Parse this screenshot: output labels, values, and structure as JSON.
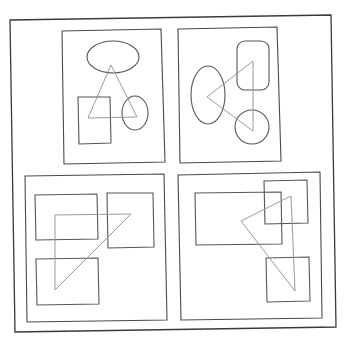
{
  "diagram": {
    "colors": {
      "background": "#ffffff",
      "frame": "#3a3a3a",
      "panel": "#4a4a4a",
      "shape": "#555555",
      "triangle": "#9a9a9a"
    },
    "outer_frame": {
      "points": "10,20 331,15 336,327 15,332"
    },
    "panels": [
      {
        "id": "top-left",
        "border": "62,31 161,29 165,162 64,164",
        "shapes": [
          {
            "type": "ellipse",
            "cx": 113,
            "cy": 57,
            "rx": 26,
            "ry": 16
          },
          {
            "type": "rect",
            "points": "78,97 110,97 111,143 79,144"
          },
          {
            "type": "ellipse",
            "cx": 135,
            "cy": 113,
            "rx": 13,
            "ry": 17
          }
        ],
        "triangle": "111,65 137,117 88,118"
      },
      {
        "id": "top-right",
        "border": "178,29 277,27 281,161 180,163",
        "shapes": [
          {
            "type": "ellipse",
            "cx": 208,
            "cy": 95,
            "rx": 17,
            "ry": 29
          },
          {
            "type": "roundrect",
            "x": 237,
            "y": 41,
            "w": 32,
            "h": 49,
            "r": 8
          },
          {
            "type": "ellipse",
            "cx": 252,
            "cy": 127,
            "rx": 17,
            "ry": 17
          }
        ],
        "triangle": "207,97 253,61 253,131"
      },
      {
        "id": "bottom-left",
        "border": "25,176 164,174 167,320 27,322",
        "shapes": [
          {
            "type": "rect",
            "points": "35,195 97,194 98,239 36,240"
          },
          {
            "type": "rect",
            "points": "107,193 153,193 154,247 108,248"
          },
          {
            "type": "rect",
            "points": "36,259 98,258 99,304 37,305"
          }
        ],
        "triangle": "55,215 131,214 55,290"
      },
      {
        "id": "bottom-right",
        "border": "178,175 320,172 322,318 181,320",
        "shapes": [
          {
            "type": "rect",
            "points": "195,193 281,192 282,244 196,245"
          },
          {
            "type": "rect",
            "points": "264,181 307,180 308,223 265,224"
          },
          {
            "type": "rect",
            "points": "266,258 309,257 310,301 267,302"
          }
        ],
        "triangle": "241,221 291,196 295,291"
      }
    ]
  }
}
